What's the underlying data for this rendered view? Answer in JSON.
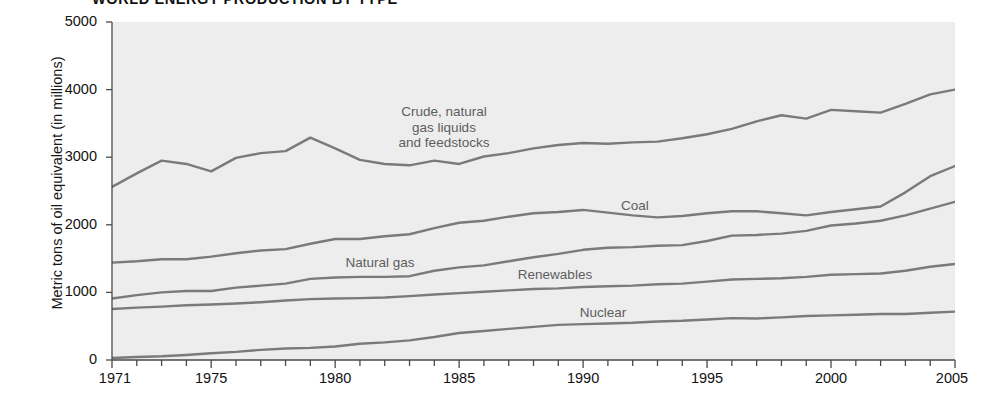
{
  "chart_data": {
    "type": "line",
    "title": "WORLD ENERGY PRODUCTION BY TYPE",
    "xlabel": "",
    "ylabel": "Metric tons of oil equivalent (in millions)",
    "xlim": [
      1971,
      2005
    ],
    "ylim": [
      0,
      5000
    ],
    "grid": false,
    "legend_position": "inline-annotations",
    "x": [
      1971,
      1972,
      1973,
      1974,
      1975,
      1976,
      1977,
      1978,
      1979,
      1980,
      1981,
      1982,
      1983,
      1984,
      1985,
      1986,
      1987,
      1988,
      1989,
      1990,
      1991,
      1992,
      1993,
      1994,
      1995,
      1996,
      1997,
      1998,
      1999,
      2000,
      2001,
      2002,
      2003,
      2004,
      2005
    ],
    "y_ticks": [
      0,
      1000,
      2000,
      3000,
      4000,
      5000
    ],
    "x_ticks_major": [
      1971,
      1975,
      1980,
      1985,
      1990,
      1995,
      2000,
      2005
    ],
    "series": [
      {
        "name": "Crude, natural gas liquids and feedstocks",
        "label": "Crude, natural\ngas liquids\nand feedstocks",
        "color": "#7a7a7a",
        "values": [
          2560,
          2760,
          2950,
          2900,
          2790,
          2990,
          3060,
          3090,
          3290,
          3130,
          2960,
          2900,
          2880,
          2950,
          2900,
          3010,
          3060,
          3130,
          3180,
          3210,
          3200,
          3220,
          3230,
          3280,
          3340,
          3420,
          3530,
          3620,
          3570,
          3700,
          3680,
          3660,
          3790,
          3930,
          4000
        ]
      },
      {
        "name": "Coal",
        "label": "Coal",
        "color": "#7a7a7a",
        "values": [
          1440,
          1460,
          1490,
          1490,
          1530,
          1580,
          1620,
          1640,
          1720,
          1790,
          1790,
          1830,
          1860,
          1950,
          2030,
          2060,
          2120,
          2170,
          2190,
          2220,
          2180,
          2140,
          2110,
          2130,
          2170,
          2200,
          2200,
          2170,
          2140,
          2190,
          2230,
          2270,
          2480,
          2720,
          2870
        ]
      },
      {
        "name": "Natural gas",
        "label": "Natural gas",
        "color": "#7a7a7a",
        "values": [
          910,
          960,
          1000,
          1020,
          1020,
          1070,
          1100,
          1130,
          1200,
          1220,
          1230,
          1230,
          1240,
          1320,
          1370,
          1400,
          1460,
          1520,
          1570,
          1630,
          1660,
          1670,
          1690,
          1700,
          1760,
          1840,
          1850,
          1870,
          1910,
          1990,
          2020,
          2060,
          2140,
          2240,
          2340
        ]
      },
      {
        "name": "Renewables",
        "label": "Renewables",
        "color": "#7a7a7a",
        "values": [
          755,
          775,
          790,
          810,
          820,
          835,
          855,
          880,
          900,
          910,
          915,
          925,
          945,
          970,
          990,
          1010,
          1030,
          1050,
          1060,
          1080,
          1090,
          1100,
          1120,
          1130,
          1160,
          1190,
          1200,
          1210,
          1230,
          1260,
          1270,
          1280,
          1320,
          1380,
          1420
        ]
      },
      {
        "name": "Nuclear",
        "label": "Nuclear",
        "color": "#7a7a7a",
        "values": [
          30,
          45,
          55,
          75,
          100,
          120,
          150,
          170,
          180,
          200,
          240,
          260,
          290,
          340,
          400,
          430,
          460,
          490,
          520,
          530,
          540,
          550,
          570,
          580,
          600,
          620,
          615,
          630,
          650,
          660,
          670,
          680,
          680,
          700,
          715
        ]
      }
    ]
  },
  "axis": {
    "y_tick_labels": [
      "0",
      "1000",
      "2000",
      "3000",
      "4000",
      "5000"
    ],
    "x_tick_labels": [
      "1971",
      "1975",
      "1980",
      "1985",
      "1990",
      "1995",
      "2000",
      "2005"
    ]
  },
  "annotations": [
    {
      "name": "crude-label",
      "text": "Crude, natural\ngas liquids\nand feedstocks",
      "x": 364,
      "y": 104,
      "width": 160
    },
    {
      "name": "coal-label",
      "text": "Coal",
      "x": 600,
      "y": 198,
      "width": 70
    },
    {
      "name": "natural-gas-label",
      "text": "Natural gas",
      "x": 325,
      "y": 255,
      "width": 110
    },
    {
      "name": "renewables-label",
      "text": "Renewables",
      "x": 495,
      "y": 267,
      "width": 120
    },
    {
      "name": "nuclear-label",
      "text": "Nuclear",
      "x": 558,
      "y": 305,
      "width": 90
    }
  ],
  "style": {
    "plot_background": "#ededed",
    "page_background": "#ffffff",
    "line_color": "#7a7a7a",
    "axis_color": "#4a4a4a",
    "label_color": "#5d5d5d"
  }
}
